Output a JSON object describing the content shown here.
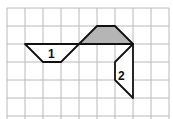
{
  "grid": {
    "origin": [
      7,
      8
    ],
    "cell": 18,
    "cols": 9,
    "rows": 6,
    "line_color": "#b8b8b8"
  },
  "shapes": [
    {
      "id": "shaded",
      "label": "",
      "fill": "#b5b5b5",
      "points": [
        [
          4,
          2
        ],
        [
          5,
          1
        ],
        [
          6,
          1
        ],
        [
          7,
          2
        ]
      ]
    },
    {
      "id": "shape-1",
      "label": "1",
      "fill": "#ffffff",
      "points": [
        [
          1,
          2
        ],
        [
          4,
          2
        ],
        [
          3,
          3
        ],
        [
          2,
          3
        ]
      ],
      "label_pos": [
        2.6,
        2.55
      ]
    },
    {
      "id": "shape-2",
      "label": "2",
      "fill": "#ffffff",
      "points": [
        [
          7,
          2
        ],
        [
          6,
          3
        ],
        [
          6,
          4
        ],
        [
          7,
          5
        ]
      ],
      "label_pos": [
        6.6,
        3.75
      ]
    }
  ],
  "labels": {
    "shape1": "1",
    "shape2": "2"
  }
}
